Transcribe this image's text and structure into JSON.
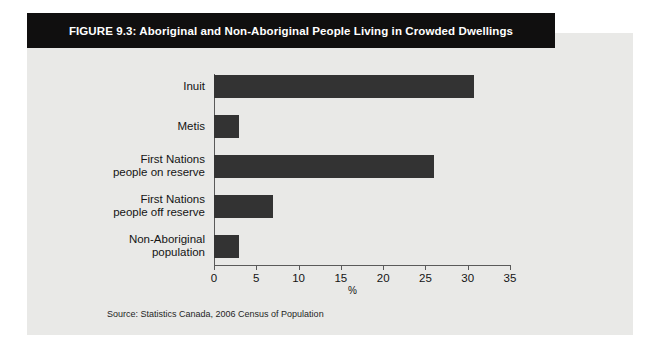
{
  "figure": {
    "title": "FIGURE 9.3:  Aboriginal and Non-Aboriginal People Living in Crowded Dwellings",
    "source": "Source: Statistics Canada, 2006 Census of Population",
    "bar_color": "#333333",
    "panel_color": "#e9e9e7",
    "banner_color": "#100f0f"
  },
  "chart_data": {
    "type": "bar",
    "orientation": "horizontal",
    "title": "FIGURE 9.3:  Aboriginal and Non-Aboriginal People Living in Crowded Dwellings",
    "categories": [
      "Inuit",
      "Metis",
      "First Nations\npeople on reserve",
      "First Nations\npeople off reserve",
      "Non-Aboriginal\npopulation"
    ],
    "values": [
      30.8,
      3.0,
      26.0,
      7.0,
      3.0
    ],
    "xlabel": "%",
    "ylabel": "",
    "xlim": [
      0,
      35
    ],
    "xticks": [
      0,
      5,
      10,
      15,
      20,
      25,
      30,
      35
    ],
    "xtick_labels": [
      "0",
      "5",
      "10",
      "15",
      "20",
      "25",
      "30",
      "35"
    ],
    "grid": false,
    "legend": null,
    "source": "Source: Statistics Canada, 2006 Census of Population"
  }
}
